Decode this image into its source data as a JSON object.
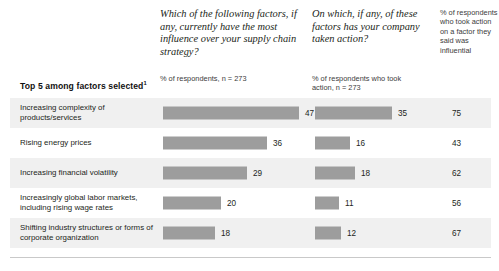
{
  "header": {
    "question_1": "Which of the following factors, if any, currently have the most influence over your supply chain strategy?",
    "question_1_sub": "% of respondents, n = 273",
    "question_2": "On which, if any, of these factors has your company taken action?",
    "question_2_sub": "% of respondents who took action, n = 273",
    "column_3_note": "% of respondents who took action on a factor they said was influential",
    "top5_label": "Top 5 among factors selected",
    "top5_footnote_marker": "1"
  },
  "colors": {
    "bar": "#9d9d9d",
    "band": "#f0f0f0",
    "text": "#231f20",
    "rule": "#c9c9c9"
  },
  "chart_data": {
    "type": "bar",
    "title": "Top 5 among factors selected",
    "xlabel": "",
    "ylabel": "",
    "grid": false,
    "orientation": "horizontal",
    "axis_max": 50,
    "categories": [
      "Increasing complexity of products/services",
      "Rising energy prices",
      "Increasing financial volatility",
      "Increasingly global labor markets, including rising wage rates",
      "Shifting industry structures or forms of corporate organization"
    ],
    "series": [
      {
        "name": "% of respondents, n = 273",
        "question": "Which of the following factors, if any, currently have the most influence over your supply chain strategy?",
        "values": [
          47,
          36,
          29,
          20,
          18
        ]
      },
      {
        "name": "% of respondents who took action, n = 273",
        "question": "On which, if any, of these factors has your company taken action?",
        "values": [
          35,
          16,
          18,
          11,
          12
        ]
      },
      {
        "name": "% of respondents who took action on a factor they said was influential",
        "type": "numeric-column",
        "values": [
          75,
          43,
          62,
          56,
          67
        ]
      }
    ]
  },
  "rows": [
    {
      "label": "Increasing complexity of products/services",
      "v1": 47,
      "v2": 35,
      "v3": 75
    },
    {
      "label": "Rising energy prices",
      "v1": 36,
      "v2": 16,
      "v3": 43
    },
    {
      "label": "Increasing financial volatility",
      "v1": 29,
      "v2": 18,
      "v3": 62
    },
    {
      "label": "Increasingly global labor markets, including rising wage rates",
      "v1": 20,
      "v2": 11,
      "v3": 56
    },
    {
      "label": "Shifting industry structures or forms of corporate organization",
      "v1": 18,
      "v2": 12,
      "v3": 67
    }
  ]
}
